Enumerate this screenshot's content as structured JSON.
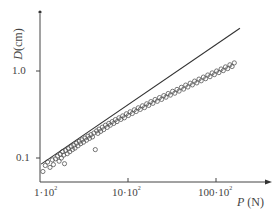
{
  "chart_data": {
    "type": "scatter",
    "title": "",
    "xscale": "log",
    "yscale": "log",
    "xlabel": {
      "symbol": "P",
      "unit": "(N)"
    },
    "ylabel": {
      "symbol": "D",
      "unit": "(cm)"
    },
    "x_ticks": [
      {
        "value": 100,
        "label_mantissa": "1·10",
        "label_exp": "2"
      },
      {
        "value": 1000,
        "label_mantissa": "10·10",
        "label_exp": "2"
      },
      {
        "value": 10000,
        "label_mantissa": "100·10",
        "label_exp": "2"
      }
    ],
    "y_ticks": [
      {
        "value": 0.1,
        "label": "0.1"
      },
      {
        "value": 1.0,
        "label": "1.0"
      }
    ],
    "xlim": [
      100,
      22000
    ],
    "ylim": [
      0.065,
      5.5
    ],
    "grid": false,
    "legend": null,
    "fit_line": {
      "x": [
        103,
        18700
      ],
      "y": [
        0.085,
        3.1
      ],
      "slope_loglog": 0.68
    },
    "series": [
      {
        "name": "measurements",
        "marker": "open-circle",
        "points": [
          [
            108,
            0.07
          ],
          [
            115,
            0.082
          ],
          [
            122,
            0.09
          ],
          [
            130,
            0.078
          ],
          [
            138,
            0.095
          ],
          [
            142,
            0.084
          ],
          [
            150,
            0.098
          ],
          [
            158,
            0.105
          ],
          [
            165,
            0.092
          ],
          [
            170,
            0.11
          ],
          [
            175,
            0.1
          ],
          [
            180,
            0.118
          ],
          [
            186,
            0.108
          ],
          [
            190,
            0.086
          ],
          [
            196,
            0.122
          ],
          [
            204,
            0.112
          ],
          [
            210,
            0.128
          ],
          [
            218,
            0.118
          ],
          [
            226,
            0.135
          ],
          [
            234,
            0.125
          ],
          [
            242,
            0.14
          ],
          [
            250,
            0.13
          ],
          [
            260,
            0.148
          ],
          [
            270,
            0.138
          ],
          [
            280,
            0.155
          ],
          [
            290,
            0.146
          ],
          [
            300,
            0.162
          ],
          [
            312,
            0.152
          ],
          [
            325,
            0.17
          ],
          [
            338,
            0.16
          ],
          [
            350,
            0.178
          ],
          [
            365,
            0.168
          ],
          [
            380,
            0.186
          ],
          [
            395,
            0.175
          ],
          [
            410,
            0.194
          ],
          [
            425,
            0.125
          ],
          [
            440,
            0.205
          ],
          [
            455,
            0.192
          ],
          [
            470,
            0.215
          ],
          [
            490,
            0.202
          ],
          [
            510,
            0.226
          ],
          [
            530,
            0.212
          ],
          [
            555,
            0.238
          ],
          [
            580,
            0.225
          ],
          [
            605,
            0.25
          ],
          [
            630,
            0.238
          ],
          [
            660,
            0.262
          ],
          [
            690,
            0.25
          ],
          [
            720,
            0.276
          ],
          [
            750,
            0.262
          ],
          [
            790,
            0.29
          ],
          [
            830,
            0.278
          ],
          [
            870,
            0.305
          ],
          [
            910,
            0.29
          ],
          [
            960,
            0.322
          ],
          [
            1010,
            0.308
          ],
          [
            1060,
            0.34
          ],
          [
            1120,
            0.325
          ],
          [
            1180,
            0.358
          ],
          [
            1240,
            0.342
          ],
          [
            1310,
            0.378
          ],
          [
            1380,
            0.362
          ],
          [
            1460,
            0.398
          ],
          [
            1540,
            0.38
          ],
          [
            1630,
            0.42
          ],
          [
            1720,
            0.402
          ],
          [
            1820,
            0.445
          ],
          [
            1920,
            0.425
          ],
          [
            2030,
            0.47
          ],
          [
            2150,
            0.448
          ],
          [
            2280,
            0.495
          ],
          [
            2410,
            0.472
          ],
          [
            2550,
            0.522
          ],
          [
            2700,
            0.5
          ],
          [
            2860,
            0.552
          ],
          [
            3030,
            0.528
          ],
          [
            3210,
            0.585
          ],
          [
            3400,
            0.555
          ],
          [
            3600,
            0.615
          ],
          [
            3810,
            0.588
          ],
          [
            4040,
            0.65
          ],
          [
            4280,
            0.62
          ],
          [
            4530,
            0.688
          ],
          [
            4800,
            0.655
          ],
          [
            5090,
            0.725
          ],
          [
            5390,
            0.692
          ],
          [
            5710,
            0.765
          ],
          [
            6050,
            0.73
          ],
          [
            6410,
            0.808
          ],
          [
            6790,
            0.772
          ],
          [
            7190,
            0.852
          ],
          [
            7620,
            0.815
          ],
          [
            8070,
            0.9
          ],
          [
            8550,
            0.86
          ],
          [
            9060,
            0.95
          ],
          [
            9600,
            0.908
          ],
          [
            10170,
            1.0
          ],
          [
            10780,
            0.958
          ],
          [
            11420,
            1.055
          ],
          [
            12100,
            1.01
          ],
          [
            12820,
            1.115
          ],
          [
            13580,
            1.065
          ],
          [
            14390,
            1.178
          ],
          [
            15250,
            1.125
          ],
          [
            16160,
            1.24
          ]
        ]
      }
    ]
  }
}
